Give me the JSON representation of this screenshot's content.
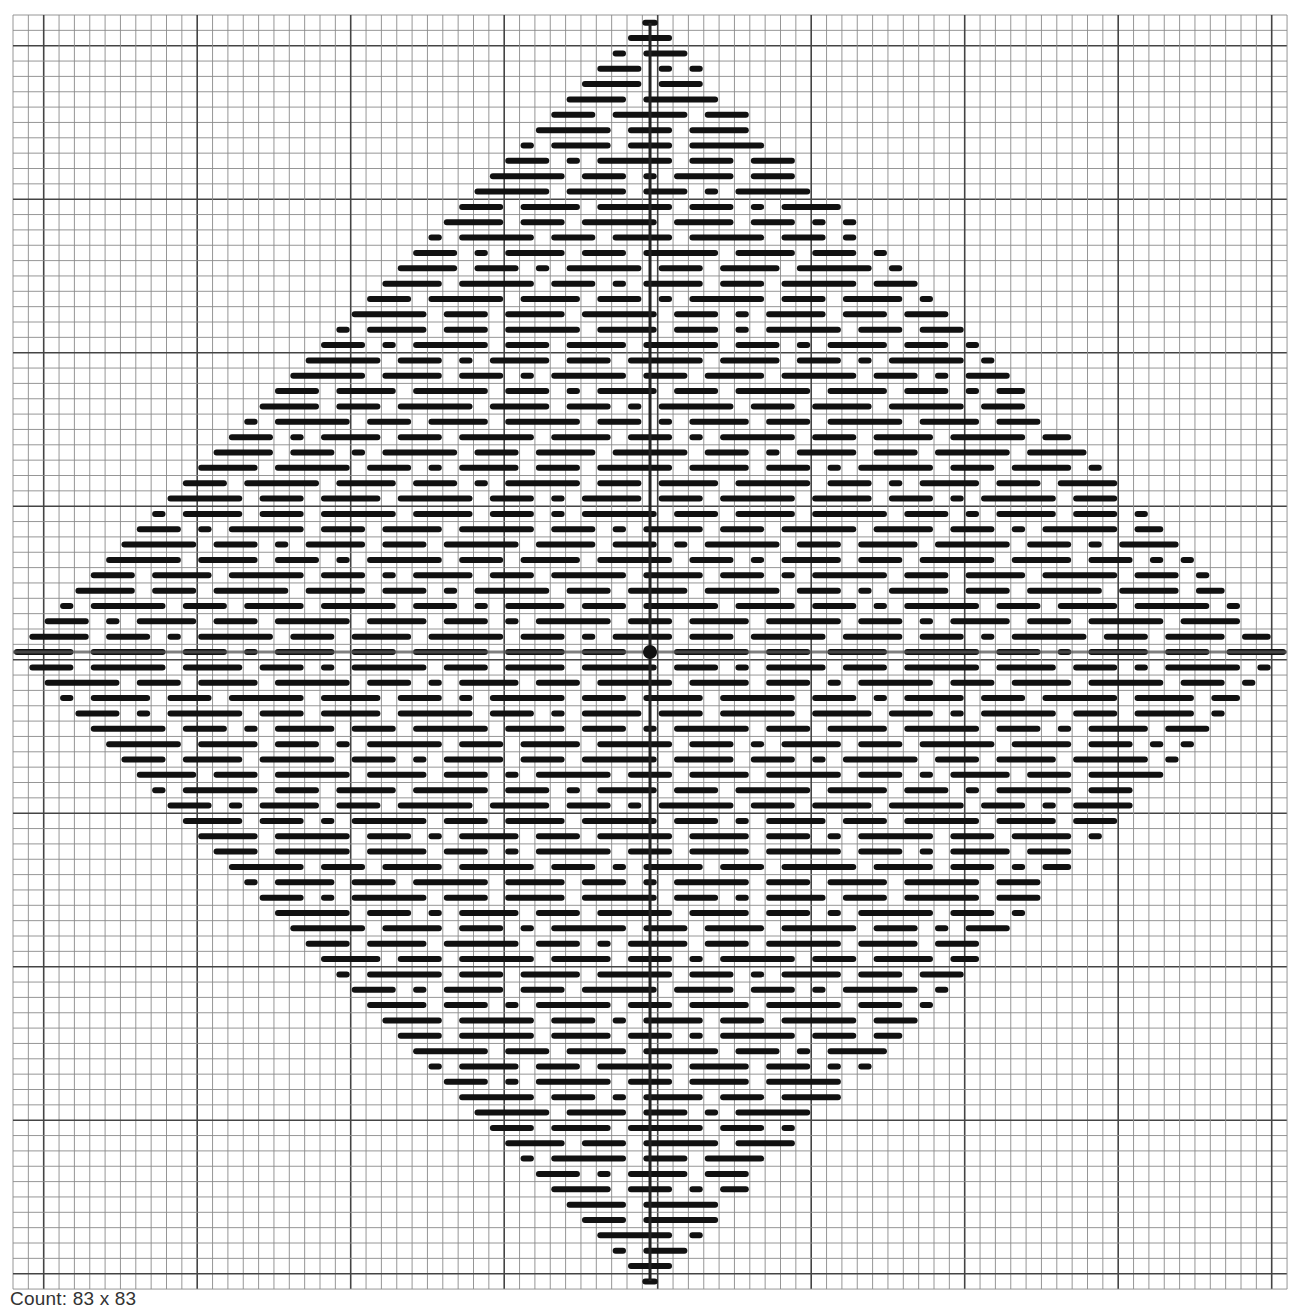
{
  "chart_data": {
    "type": "heatmap",
    "title": "",
    "grid": {
      "columns": 83,
      "rows": 83,
      "major_line_every": 10,
      "major_line_offset": 2,
      "origin_px": [
        13,
        15
      ],
      "cell_px": 15.35,
      "line_color": "#8a8a8a",
      "major_line_color": "#444444",
      "center_line_color": "#555555"
    },
    "pattern": {
      "shape": "diamond",
      "center_cell": [
        41,
        41
      ],
      "stitch_color": "#111111",
      "stitch_lengths_cells": [
        1,
        3,
        4,
        5
      ],
      "center_marker": "filled-circle"
    }
  },
  "caption": {
    "label": "Count: 83 x 83"
  }
}
